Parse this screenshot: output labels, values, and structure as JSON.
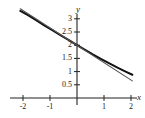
{
  "chart_data": {
    "type": "line",
    "title": "",
    "xlabel": "x",
    "ylabel": "y",
    "xlim": [
      -2.1,
      2.25
    ],
    "ylim": [
      0,
      3.35
    ],
    "grid": false,
    "legend": "none",
    "x_ticks": [
      {
        "value": -2,
        "label": "-2"
      },
      {
        "value": -1,
        "label": "-1"
      },
      {
        "value": 1,
        "label": "1"
      },
      {
        "value": 2,
        "label": "2"
      }
    ],
    "y_ticks": [
      {
        "value": 0.5,
        "label": "0.5"
      },
      {
        "value": 1,
        "label": "1"
      },
      {
        "value": 1.5,
        "label": "1.5"
      },
      {
        "value": 2,
        "label": "2"
      },
      {
        "value": 2.5,
        "label": "2.5"
      },
      {
        "value": 3,
        "label": "3"
      }
    ],
    "series": [
      {
        "name": "curve",
        "color": "#111111",
        "width": 2.0,
        "points": [
          [
            -2.1,
            3.3
          ],
          [
            -1.8,
            3.13
          ],
          [
            -1.5,
            2.94
          ],
          [
            -1.2,
            2.74
          ],
          [
            -0.9,
            2.56
          ],
          [
            -0.6,
            2.37
          ],
          [
            -0.3,
            2.19
          ],
          [
            0.0,
            2.0
          ],
          [
            0.3,
            1.82
          ],
          [
            0.6,
            1.64
          ],
          [
            0.9,
            1.47
          ],
          [
            1.2,
            1.31
          ],
          [
            1.5,
            1.15
          ],
          [
            1.8,
            1.0
          ],
          [
            2.05,
            0.88
          ]
        ]
      },
      {
        "name": "tangent-line",
        "color": "#555555",
        "width": 1.1,
        "points": [
          [
            -2.1,
            3.38
          ],
          [
            0.0,
            2.0
          ],
          [
            2.05,
            0.65
          ]
        ]
      }
    ]
  },
  "axes": {
    "y_axis_name": "y",
    "x_axis_name": "x"
  }
}
